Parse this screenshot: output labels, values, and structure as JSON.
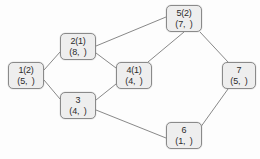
{
  "diagram": {
    "background_color": "#fdfdfd",
    "node_fill_color": "#eeeeee",
    "node_border_color": "#8a8a8a",
    "edge_color": "#7a7a7a",
    "text_color": "#2b2b2b",
    "nodes": [
      {
        "id": "1",
        "line1": "1(2)",
        "line2": "(5,  )",
        "x": 8,
        "y": 62,
        "w": 36,
        "h": 27
      },
      {
        "id": "2",
        "line1": "2(1)",
        "line2": "(8,  )",
        "x": 60,
        "y": 33,
        "w": 36,
        "h": 27
      },
      {
        "id": "3",
        "line1": "3",
        "line2": "(4,  )",
        "x": 60,
        "y": 92,
        "w": 36,
        "h": 27
      },
      {
        "id": "4",
        "line1": "4(1)",
        "line2": "(4,  )",
        "x": 116,
        "y": 62,
        "w": 36,
        "h": 27
      },
      {
        "id": "5",
        "line1": "5(2)",
        "line2": "(7,  )",
        "x": 166,
        "y": 5,
        "w": 36,
        "h": 27
      },
      {
        "id": "6",
        "line1": "6",
        "line2": "(1,  )",
        "x": 166,
        "y": 122,
        "w": 36,
        "h": 27
      },
      {
        "id": "7",
        "line1": "7",
        "line2": "(5,  )",
        "x": 222,
        "y": 62,
        "w": 34,
        "h": 27
      }
    ],
    "edges": [
      {
        "from": "1",
        "to": "2",
        "x1": 44,
        "y1": 70,
        "x2": 60,
        "y2": 52
      },
      {
        "from": "1",
        "to": "3",
        "x1": 44,
        "y1": 80,
        "x2": 60,
        "y2": 99
      },
      {
        "from": "2",
        "to": "5",
        "x1": 96,
        "y1": 46,
        "x2": 166,
        "y2": 17
      },
      {
        "from": "2",
        "to": "4",
        "x1": 96,
        "y1": 53,
        "x2": 116,
        "y2": 68
      },
      {
        "from": "3",
        "to": "4",
        "x1": 96,
        "y1": 100,
        "x2": 116,
        "y2": 84
      },
      {
        "from": "3",
        "to": "6",
        "x1": 96,
        "y1": 110,
        "x2": 166,
        "y2": 138
      },
      {
        "from": "4",
        "to": "5",
        "x1": 148,
        "y1": 62,
        "x2": 184,
        "y2": 32
      },
      {
        "from": "5",
        "to": "7",
        "x1": 200,
        "y1": 32,
        "x2": 228,
        "y2": 62
      },
      {
        "from": "6",
        "to": "7",
        "x1": 200,
        "y1": 128,
        "x2": 228,
        "y2": 89
      }
    ]
  }
}
